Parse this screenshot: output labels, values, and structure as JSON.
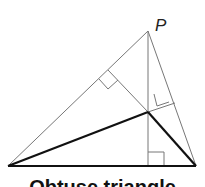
{
  "diagram": {
    "point_label": "P",
    "caption": "Obtuse triangle",
    "colors": {
      "thin_line": "#777777",
      "thick_line": "#111111"
    }
  }
}
